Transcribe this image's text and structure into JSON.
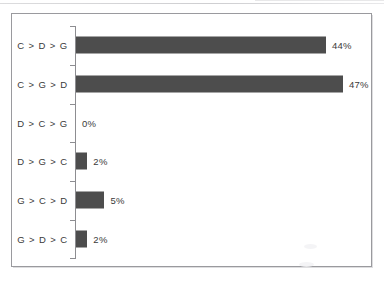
{
  "chart_data": {
    "type": "bar",
    "orientation": "horizontal",
    "title": "",
    "subtitle": "",
    "xlabel": "",
    "ylabel": "",
    "categories": [
      "C > D > G",
      "C > G > D",
      "D > C > G",
      "D > G > C",
      "G > C > D",
      "G > D > C"
    ],
    "values": [
      44,
      47,
      0,
      2,
      5,
      2
    ],
    "value_labels": [
      "44%",
      "47%",
      "0%",
      "2%",
      "5%",
      "2%"
    ],
    "xlim": [
      0,
      50
    ],
    "grid": false,
    "legend": null,
    "bar_color": "#4d4d4d",
    "axis_color": "#8d8d91",
    "frame_color": "#9a9a9e",
    "background": "#ffffff"
  },
  "chart": {
    "bars": [
      {
        "category": "C > D > G",
        "value": 44,
        "label": "44%"
      },
      {
        "category": "C > G > D",
        "value": 47,
        "label": "47%"
      },
      {
        "category": "D > C > G",
        "value": 0,
        "label": "0%"
      },
      {
        "category": "D > G > C",
        "value": 2,
        "label": "2%"
      },
      {
        "category": "G > C > D",
        "value": 5,
        "label": "5%"
      },
      {
        "category": "G > D > C",
        "value": 2,
        "label": "2%"
      }
    ]
  }
}
